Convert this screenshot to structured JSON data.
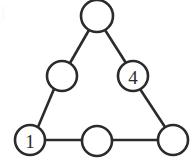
{
  "figure": {
    "background_color": "#ffffff",
    "stroke_color": "#2b2b2b",
    "stroke_width": 2.6,
    "node_fill": "#ffffff",
    "node_radius": 15,
    "apex_radius": 16,
    "width": 192,
    "height": 161
  },
  "nodes": [
    {
      "id": "apex",
      "name": "node-apex",
      "label": "",
      "cx": 97,
      "cy": 16,
      "r": 16,
      "filled": false
    },
    {
      "id": "left-mid",
      "name": "node-left-middle",
      "label": "",
      "cx": 62,
      "cy": 76,
      "r": 15,
      "filled": false
    },
    {
      "id": "right-mid",
      "name": "node-right-middle",
      "label": "4",
      "cx": 133,
      "cy": 76,
      "r": 15,
      "filled": true
    },
    {
      "id": "bottom-left",
      "name": "node-bottom-left",
      "label": "1",
      "cx": 30,
      "cy": 140,
      "r": 15,
      "filled": true
    },
    {
      "id": "bottom-mid",
      "name": "node-bottom-middle",
      "label": "",
      "cx": 97,
      "cy": 141,
      "r": 15,
      "filled": false
    },
    {
      "id": "bottom-right",
      "name": "node-bottom-right",
      "label": "",
      "cx": 173,
      "cy": 140,
      "r": 15,
      "filled": false
    }
  ],
  "edges": [
    {
      "id": "apex-to-left-mid",
      "name": "edge-apex-left-middle",
      "x1": 89,
      "y1": 30,
      "x2": 70,
      "y2": 63
    },
    {
      "id": "apex-to-right-mid",
      "name": "edge-apex-right-middle",
      "x1": 105,
      "y1": 30,
      "x2": 126,
      "y2": 63
    },
    {
      "id": "left-mid-to-bottom-left",
      "name": "edge-left-middle-bottom-left",
      "x1": 54,
      "y1": 89,
      "x2": 38,
      "y2": 127
    },
    {
      "id": "right-mid-to-bottom-right",
      "name": "edge-right-middle-bottom-right",
      "x1": 140,
      "y1": 89,
      "x2": 165,
      "y2": 127
    },
    {
      "id": "bottom-left-to-bottom-mid",
      "name": "edge-bottom-left-bottom-middle",
      "x1": 45,
      "y1": 140,
      "x2": 82,
      "y2": 140
    },
    {
      "id": "bottom-mid-to-bottom-right",
      "name": "edge-bottom-middle-bottom-right",
      "x1": 112,
      "y1": 140,
      "x2": 158,
      "y2": 140
    }
  ],
  "labels": {
    "node_values": [
      "",
      "",
      "4",
      "1",
      "",
      ""
    ]
  }
}
